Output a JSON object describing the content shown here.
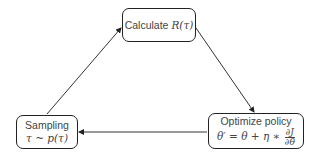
{
  "diagram": {
    "type": "cycle",
    "nodes": [
      {
        "id": "calculate",
        "label": "Calculate",
        "math": "R(τ)"
      },
      {
        "id": "optimize",
        "label": "Optimize policy",
        "math_lhs": "θ′ = θ + η ∗",
        "frac_num": "∂J",
        "frac_den": "∂θ"
      },
      {
        "id": "sampling",
        "label": "Sampling",
        "math": "τ ~ p(τ)"
      }
    ],
    "edges": [
      {
        "from": "sampling",
        "to": "calculate"
      },
      {
        "from": "calculate",
        "to": "optimize"
      },
      {
        "from": "optimize",
        "to": "sampling"
      }
    ],
    "colors": {
      "stroke": "#222222",
      "text": "#444444",
      "background": "#ffffff"
    }
  }
}
